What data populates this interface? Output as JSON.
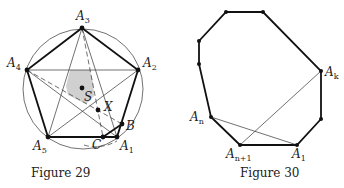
{
  "figures": [
    {
      "caption": "Figure 29",
      "labels": {
        "A1": {
          "base": "A",
          "sub": "1"
        },
        "A2": {
          "base": "A",
          "sub": "2"
        },
        "A3": {
          "base": "A",
          "sub": "3"
        },
        "A4": {
          "base": "A",
          "sub": "4"
        },
        "A5": {
          "base": "A",
          "sub": "5"
        },
        "S": "S",
        "X": "X",
        "B": "B",
        "C": "C"
      },
      "colors": {
        "shade": "#d0d0d0",
        "stroke": "#111111"
      }
    },
    {
      "caption": "Figure 30",
      "labels": {
        "Ak": {
          "base": "A",
          "sub": "k"
        },
        "An": {
          "base": "A",
          "sub": "n"
        },
        "An1": {
          "base": "A",
          "sub": "n+1"
        },
        "A1": {
          "base": "A",
          "sub": "1"
        }
      }
    }
  ]
}
